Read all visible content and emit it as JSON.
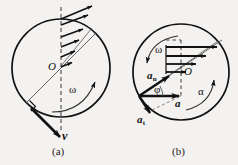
{
  "figure": {
    "background_color": "#f4f2f0",
    "ink_color": "#111111",
    "width": 238,
    "height": 165
  },
  "panels": [
    {
      "id": "a",
      "caption": "(a)",
      "title_hint": "velocity distribution on a rolling disc",
      "circle": {
        "cx": 61,
        "cy": 68,
        "r": 49
      },
      "center_label": "O",
      "labels": {
        "velocity": "v",
        "omega": "ω"
      },
      "annotations": {
        "right_angle_mark": true,
        "dashed_axis": true,
        "arrow_count": 5
      }
    },
    {
      "id": "b",
      "caption": "(b)",
      "title_hint": "acceleration components on a rolling disc",
      "circle": {
        "cx": 181,
        "cy": 72,
        "r": 48
      },
      "center_label": "O",
      "labels": {
        "omega": "ω",
        "alpha": "α",
        "phi": "φ",
        "accel_total": "a",
        "accel_normal_base": "a",
        "accel_normal_sub": "n",
        "accel_tangential_base": "a",
        "accel_tangential_sub": "t"
      },
      "annotations": {
        "dashed_axis": true,
        "arrow_count": 4
      }
    }
  ]
}
